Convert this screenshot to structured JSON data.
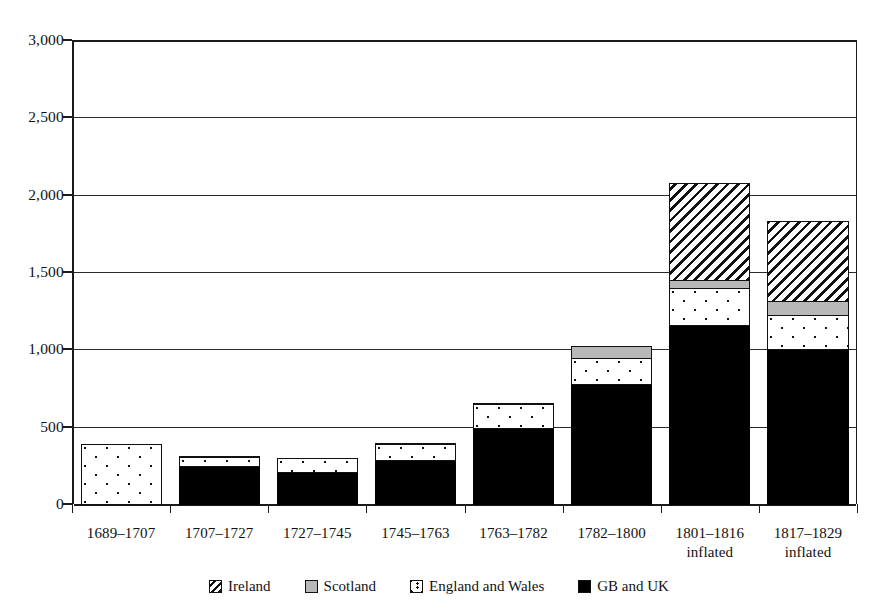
{
  "chart_data": {
    "type": "bar",
    "subtype": "stacked",
    "title": "",
    "xlabel": "",
    "ylabel": "",
    "ylim": [
      0,
      3000
    ],
    "yticks": [
      "0",
      "500",
      "1,000",
      "1,500",
      "2,000",
      "2,500",
      "3,000"
    ],
    "ytick_values": [
      0,
      500,
      1000,
      1500,
      2000,
      2500,
      3000
    ],
    "grid": true,
    "grid_axis": "y",
    "legend_position": "bottom",
    "categories": [
      "1689–1707",
      "1707–1727",
      "1727–1745",
      "1745–1763",
      "1763–1782",
      "1782–1800",
      "1801–1816\ninflated",
      "1817–1829\ninflated"
    ],
    "series": [
      {
        "name": "GB and UK",
        "key": "gb",
        "color": "#000000",
        "pattern": "solid-black",
        "values": [
          0,
          250,
          215,
          290,
          500,
          780,
          1165,
          1010
        ]
      },
      {
        "name": "England and Wales",
        "key": "ew",
        "color": "#ffffff",
        "pattern": "dotted",
        "values": [
          395,
          65,
          95,
          110,
          160,
          180,
          245,
          225
        ]
      },
      {
        "name": "Scotland",
        "key": "sc",
        "color": "#b8b8b8",
        "pattern": "solid-grey",
        "values": [
          0,
          10,
          0,
          15,
          10,
          80,
          60,
          95
        ]
      },
      {
        "name": "Ireland",
        "key": "ir",
        "color": "#ffffff",
        "pattern": "diagonal-hatch",
        "values": [
          0,
          0,
          0,
          0,
          0,
          0,
          630,
          525
        ]
      }
    ],
    "totals": [
      395,
      325,
      310,
      415,
      670,
      1040,
      2100,
      1855
    ]
  },
  "legend": {
    "items": [
      {
        "label": "Ireland",
        "swatch": "ireland-hatch-swatch"
      },
      {
        "label": "Scotland",
        "swatch": "scotland-grey-swatch"
      },
      {
        "label": "England and Wales",
        "swatch": "england-wales-dotted-swatch"
      },
      {
        "label": "GB and UK",
        "swatch": "gb-uk-black-swatch"
      }
    ]
  }
}
